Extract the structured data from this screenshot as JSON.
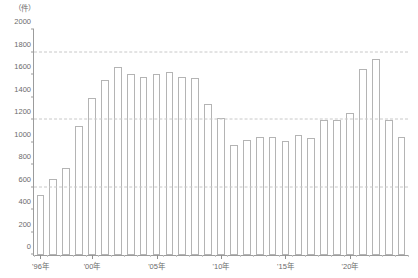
{
  "chart_data": {
    "type": "bar",
    "title": "",
    "subtitle": "",
    "xlabel": "",
    "ylabel": "",
    "unit_label": "（件）",
    "ylim": [
      0,
      2000
    ],
    "y_ticks": [
      0,
      200,
      400,
      600,
      800,
      1000,
      1200,
      1400,
      1600,
      1800,
      2000
    ],
    "y_tick_labels": [
      "0",
      "200",
      "400",
      "600",
      "800",
      "1000",
      "1200",
      "1400",
      "1600",
      "1800",
      "2000"
    ],
    "gridlines": [
      600,
      1200,
      1800
    ],
    "grid": "horizontal-dashed",
    "legend": "none",
    "bar_color": "#ffffff",
    "bar_edge_color": "#b4b4b4",
    "axis_color": "#9c9c9c",
    "grid_color": "#c8c8c8",
    "text_color": "#6b6b6b",
    "categories": [
      "1996",
      "1997",
      "1998",
      "1999",
      "2000",
      "2001",
      "2002",
      "2003",
      "2004",
      "2005",
      "2006",
      "2007",
      "2008",
      "2009",
      "2010",
      "2011",
      "2012",
      "2013",
      "2014",
      "2015",
      "2016",
      "2017",
      "2018",
      "2019",
      "2020",
      "2021",
      "2022",
      "2023",
      "2024"
    ],
    "values": [
      535,
      675,
      775,
      1150,
      1395,
      1560,
      1675,
      1610,
      1580,
      1610,
      1625,
      1580,
      1575,
      1340,
      1215,
      975,
      1020,
      1045,
      1050,
      1015,
      1070,
      1040,
      1200,
      1200,
      1265,
      1650,
      1740,
      1200,
      1050
    ],
    "x_labeled_ticks": [
      {
        "index": 0,
        "label": "'96年"
      },
      {
        "index": 4,
        "label": "'00年"
      },
      {
        "index": 9,
        "label": "'05年"
      },
      {
        "index": 14,
        "label": "'10年"
      },
      {
        "index": 19,
        "label": "'15年"
      },
      {
        "index": 24,
        "label": "'20年"
      }
    ]
  }
}
